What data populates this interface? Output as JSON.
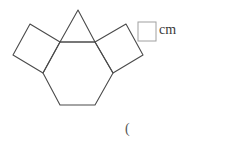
{
  "figure": {
    "shapes": [
      {
        "name": "hexagon",
        "points": "60,42 95,42 113,73 95,105 60,105 43,73"
      },
      {
        "name": "triangle",
        "points": "60,42 78,10 95,42"
      },
      {
        "name": "left-square",
        "points": "60,42 30,24 13,55 43,73"
      },
      {
        "name": "right-square",
        "points": "95,42 126,24 143,55 113,73"
      }
    ],
    "stroke_color": "#4a4a4a"
  },
  "answer": {
    "box_value": "",
    "unit": "cm"
  },
  "footer": {
    "paren": "("
  }
}
